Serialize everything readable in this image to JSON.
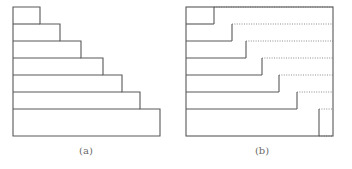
{
  "figure": {
    "background_color": "#ffffff",
    "stroke_color": "#585858",
    "dotted_color": "#8c8c8c",
    "caption_color": "#6a6a6a",
    "stroke_width": 1.1,
    "panels": [
      {
        "id": "panel-a",
        "caption": "(a)",
        "caption_x": 86,
        "caption_y": 154,
        "type": "staircase-polygon",
        "origin_x": 13,
        "top_y": 7,
        "bottom_y": 136,
        "bars": [
          {
            "index": 1,
            "top": 7,
            "bottom": 24,
            "right": 40
          },
          {
            "index": 2,
            "top": 24,
            "bottom": 41,
            "right": 60
          },
          {
            "index": 3,
            "top": 41,
            "bottom": 58,
            "right": 81
          },
          {
            "index": 4,
            "top": 58,
            "bottom": 75,
            "right": 103
          },
          {
            "index": 5,
            "top": 75,
            "bottom": 92,
            "right": 122
          },
          {
            "index": 6,
            "top": 92,
            "bottom": 109,
            "right": 140
          },
          {
            "index": 7,
            "top": 109,
            "bottom": 136,
            "right": 160
          }
        ]
      },
      {
        "id": "panel-b",
        "caption": "(b)",
        "caption_x": 262,
        "caption_y": 154,
        "type": "staircase-in-bounding-box",
        "origin_x": 186,
        "box_right": 333,
        "top_y": 7,
        "bottom_y": 136,
        "bars": [
          {
            "index": 1,
            "top": 7,
            "bottom": 24,
            "right": 214
          },
          {
            "index": 2,
            "top": 24,
            "bottom": 41,
            "right": 232
          },
          {
            "index": 3,
            "top": 41,
            "bottom": 58,
            "right": 246
          },
          {
            "index": 4,
            "top": 58,
            "bottom": 75,
            "right": 262
          },
          {
            "index": 5,
            "top": 75,
            "bottom": 92,
            "right": 279
          },
          {
            "index": 6,
            "top": 92,
            "bottom": 109,
            "right": 297
          },
          {
            "index": 7,
            "top": 109,
            "bottom": 136,
            "right": 319
          }
        ]
      }
    ]
  }
}
